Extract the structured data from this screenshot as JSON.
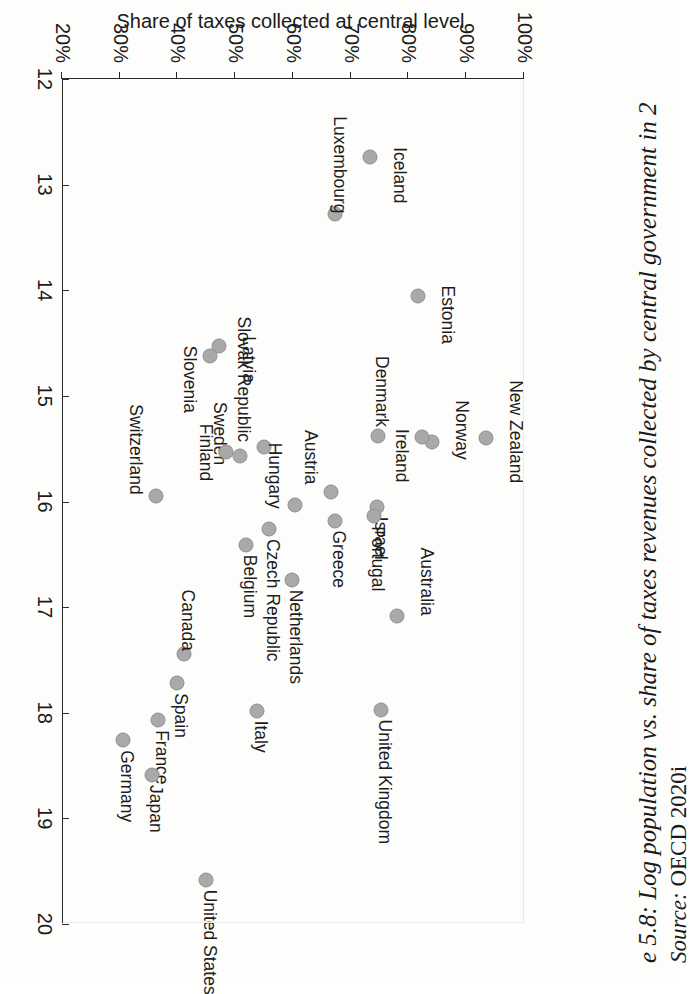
{
  "figure": {
    "caption": "e 5.8: Log population vs. share of taxes revenues collected by central government in 2",
    "source_label": "Source:",
    "source_value": "OECD 2020i"
  },
  "axes": {
    "x_title": "Natural logarithm of population",
    "y_title": "Share of taxes collected at central level",
    "x_ticks": [
      "12",
      "13",
      "14",
      "15",
      "16",
      "17",
      "18",
      "19",
      "20"
    ],
    "y_ticks": [
      "20%",
      "30%",
      "40%",
      "50%",
      "60%",
      "70%",
      "80%",
      "90%",
      "100%"
    ],
    "x_min": 12,
    "x_max": 20,
    "y_min": 20,
    "y_max": 100
  },
  "style": {
    "marker_fill": "#a9a9a9",
    "marker_stroke": "#8e8e8e",
    "axis_color": "#2a2a2a",
    "text_color": "#1b1b1b"
  },
  "chart_data": {
    "type": "scatter",
    "title": "Log population vs. share of taxes revenues collected by central government",
    "xlabel": "Natural logarithm of population",
    "ylabel": "Share of taxes collected at central level",
    "xlim": [
      12,
      20
    ],
    "ylim": [
      20,
      100
    ],
    "grid": false,
    "legend": "none",
    "source": "OECD 2020i",
    "point_label_unit": "country",
    "points": [
      {
        "label": "Iceland",
        "x": 12.74,
        "y": 73.3,
        "lx": -10,
        "ly": -30,
        "anchor": "start"
      },
      {
        "label": "Luxembourg",
        "x": 13.28,
        "y": 67.2,
        "lx": -98,
        "ly": -5,
        "anchor": "start"
      },
      {
        "label": "Estonia",
        "x": 14.05,
        "y": 81.7,
        "lx": -10,
        "ly": -30,
        "anchor": "start"
      },
      {
        "label": "Latvia",
        "x": 14.53,
        "y": 47.2,
        "lx": -10,
        "ly": -30,
        "anchor": "start"
      },
      {
        "label": "Slovenia",
        "x": 14.62,
        "y": 45.6,
        "lx": -10,
        "ly": 20,
        "anchor": "start"
      },
      {
        "label": "New Zealand",
        "x": 15.4,
        "y": 93.5,
        "lx": -58,
        "ly": -30,
        "anchor": "start"
      },
      {
        "label": "Norway",
        "x": 15.44,
        "y": 84.0,
        "lx": -42,
        "ly": -30,
        "anchor": "start"
      },
      {
        "label": "Ireland",
        "x": 15.39,
        "y": 82.3,
        "lx": -8,
        "ly": 20,
        "anchor": "start"
      },
      {
        "label": "Denmark",
        "x": 15.38,
        "y": 74.8,
        "lx": -80,
        "ly": -4,
        "anchor": "start"
      },
      {
        "label": "Slovak Republic",
        "x": 15.48,
        "y": 55.0,
        "lx": -130,
        "ly": 20,
        "anchor": "start"
      },
      {
        "label": "Sweden",
        "x": 15.57,
        "y": 50.8,
        "lx": -54,
        "ly": 20,
        "anchor": "start"
      },
      {
        "label": "Finland",
        "x": 15.53,
        "y": 48.4,
        "lx": -28,
        "ly": 20,
        "anchor": "start"
      },
      {
        "label": "Israel",
        "x": 16.05,
        "y": 74.6,
        "lx": 10,
        "ly": -4,
        "anchor": "start"
      },
      {
        "label": "Austria",
        "x": 15.91,
        "y": 66.5,
        "lx": -62,
        "ly": 20,
        "anchor": "start"
      },
      {
        "label": "Portugal",
        "x": 16.14,
        "y": 74.0,
        "lx": 10,
        "ly": -4,
        "anchor": "start"
      },
      {
        "label": "Greece",
        "x": 16.18,
        "y": 67.3,
        "lx": 10,
        "ly": -4,
        "anchor": "start"
      },
      {
        "label": "Hungary",
        "x": 16.03,
        "y": 60.3,
        "lx": -62,
        "ly": 20,
        "anchor": "start"
      },
      {
        "label": "Switzerland",
        "x": 15.95,
        "y": 36.3,
        "lx": -92,
        "ly": 20,
        "anchor": "start"
      },
      {
        "label": "Czech Republic",
        "x": 16.26,
        "y": 55.8,
        "lx": 10,
        "ly": -4,
        "anchor": "start"
      },
      {
        "label": "Belgium",
        "x": 16.41,
        "y": 51.8,
        "lx": 10,
        "ly": -4,
        "anchor": "start"
      },
      {
        "label": "Netherlands",
        "x": 16.74,
        "y": 59.8,
        "lx": 10,
        "ly": -4,
        "anchor": "start"
      },
      {
        "label": "Australia",
        "x": 17.08,
        "y": 78.0,
        "lx": -68,
        "ly": -30,
        "anchor": "start"
      },
      {
        "label": "Canada",
        "x": 17.44,
        "y": 41.2,
        "lx": -64,
        "ly": -4,
        "anchor": "start"
      },
      {
        "label": "Spain",
        "x": 17.72,
        "y": 40.0,
        "lx": 10,
        "ly": -4,
        "anchor": "start"
      },
      {
        "label": "Italy",
        "x": 17.98,
        "y": 53.7,
        "lx": 10,
        "ly": -4,
        "anchor": "start"
      },
      {
        "label": "United Kingdom",
        "x": 17.97,
        "y": 75.3,
        "lx": 10,
        "ly": -4,
        "anchor": "start"
      },
      {
        "label": "France",
        "x": 18.07,
        "y": 36.6,
        "lx": 10,
        "ly": -4,
        "anchor": "start"
      },
      {
        "label": "Germany",
        "x": 18.26,
        "y": 30.6,
        "lx": 10,
        "ly": -4,
        "anchor": "start"
      },
      {
        "label": "Japan",
        "x": 18.59,
        "y": 35.6,
        "lx": 10,
        "ly": -4,
        "anchor": "start"
      },
      {
        "label": "United States",
        "x": 19.58,
        "y": 44.9,
        "lx": 10,
        "ly": -4,
        "anchor": "start"
      }
    ]
  }
}
